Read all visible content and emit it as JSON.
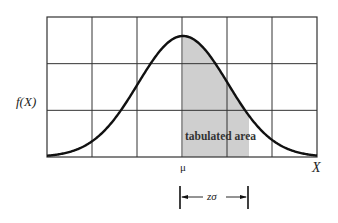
{
  "figure": {
    "y_axis_label": "f(X)",
    "x_axis_label": "X",
    "mean_label": "μ",
    "shaded_label": "tabulated area",
    "interval_label": "zσ",
    "grid": {
      "columns": 6,
      "rows": 3
    },
    "colors": {
      "curve": "#111111",
      "grid": "#333333",
      "shade": "#cfcfcf"
    }
  },
  "chart_data": {
    "type": "area",
    "title": "",
    "xlabel": "X",
    "ylabel": "f(X)",
    "annotations": [
      "μ",
      "zσ",
      "tabulated area"
    ],
    "shaded_interval": [
      "μ",
      "μ+zσ"
    ],
    "grid": true
  }
}
